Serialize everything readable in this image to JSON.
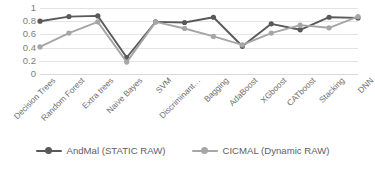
{
  "chart_data": {
    "type": "line",
    "title": "",
    "xlabel": "",
    "ylabel": "",
    "ylim": [
      0,
      1
    ],
    "ytick_values": [
      1,
      0.8,
      0.6,
      0.4,
      0.2,
      0
    ],
    "ytick_labels": [
      "1",
      "0.8",
      "0.6",
      "0.4",
      "0.2",
      "0"
    ],
    "grid": true,
    "legend_position": "bottom",
    "categories": [
      "Decision Trees",
      "Random Forest",
      "Extra trees",
      "Naive Bayes",
      "SVM",
      "Discriminant…",
      "Bagging",
      "AdaBoost",
      "XGboost",
      "CATboost",
      "Stacking",
      "DNN"
    ],
    "series": [
      {
        "name": "AndMal (STATIC RAW)",
        "color": "#595959",
        "marker": "circle",
        "values": [
          0.8,
          0.87,
          0.88,
          0.25,
          0.79,
          0.78,
          0.86,
          0.42,
          0.76,
          0.67,
          0.86,
          0.85
        ]
      },
      {
        "name": "CICMAL (Dynamic RAW)",
        "color": "#a6a6a6",
        "marker": "circle",
        "values": [
          0.41,
          0.62,
          0.79,
          0.18,
          0.79,
          0.69,
          0.57,
          0.44,
          0.62,
          0.74,
          0.7,
          0.87
        ]
      }
    ]
  },
  "legend": {
    "items": [
      {
        "label": "AndMal (STATIC RAW)",
        "color": "#595959"
      },
      {
        "label": "CICMAL (Dynamic RAW)",
        "color": "#a6a6a6"
      }
    ]
  },
  "colors": {
    "gridline": "#e3e3e3",
    "axis_text": "#7d7d7d",
    "background": "#ffffff"
  }
}
